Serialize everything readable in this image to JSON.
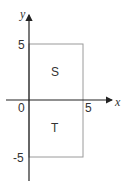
{
  "diagram": {
    "type": "coordinate-plane-regions",
    "axes": {
      "x_label": "x",
      "y_label": "y",
      "origin_label": "0",
      "tick_labels": {
        "x_pos": "5",
        "y_pos": "5",
        "y_neg": "-5"
      },
      "color": "#222222"
    },
    "rectangle": {
      "x_range": [
        0,
        5
      ],
      "y_range": [
        -5,
        5
      ],
      "color": "#9a9a9a"
    },
    "regions": [
      {
        "label": "S",
        "location": "upper half (y > 0)"
      },
      {
        "label": "T",
        "location": "lower half (y < 0)"
      }
    ]
  }
}
